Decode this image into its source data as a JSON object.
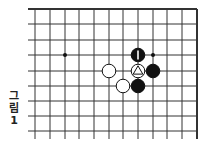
{
  "caption": {
    "chars": [
      "그",
      "림",
      "1"
    ],
    "text": "그림 1"
  },
  "board": {
    "columns_x": [
      35,
      50,
      65,
      79,
      94,
      109,
      123,
      138,
      153,
      167,
      182,
      197
    ],
    "rows_y": [
      9,
      24,
      40,
      55,
      71,
      86,
      101,
      116,
      131
    ],
    "left_extend_x": 28,
    "bottom_extend_y": 139,
    "top_edge": true,
    "right_edge": true,
    "line_color": "#333333",
    "star_points": [
      {
        "col": 2,
        "row": 3
      },
      {
        "col": 8,
        "row": 3
      }
    ],
    "stones": [
      {
        "col": 7,
        "row": 3,
        "color": "black",
        "mark": "vertical-line"
      },
      {
        "col": 5,
        "row": 4,
        "color": "white",
        "mark": ""
      },
      {
        "col": 7,
        "row": 4,
        "color": "white",
        "mark": "triangle"
      },
      {
        "col": 8,
        "row": 4,
        "color": "black",
        "mark": ""
      },
      {
        "col": 6,
        "row": 5,
        "color": "white",
        "mark": ""
      },
      {
        "col": 7,
        "row": 5,
        "color": "black",
        "mark": ""
      }
    ]
  }
}
